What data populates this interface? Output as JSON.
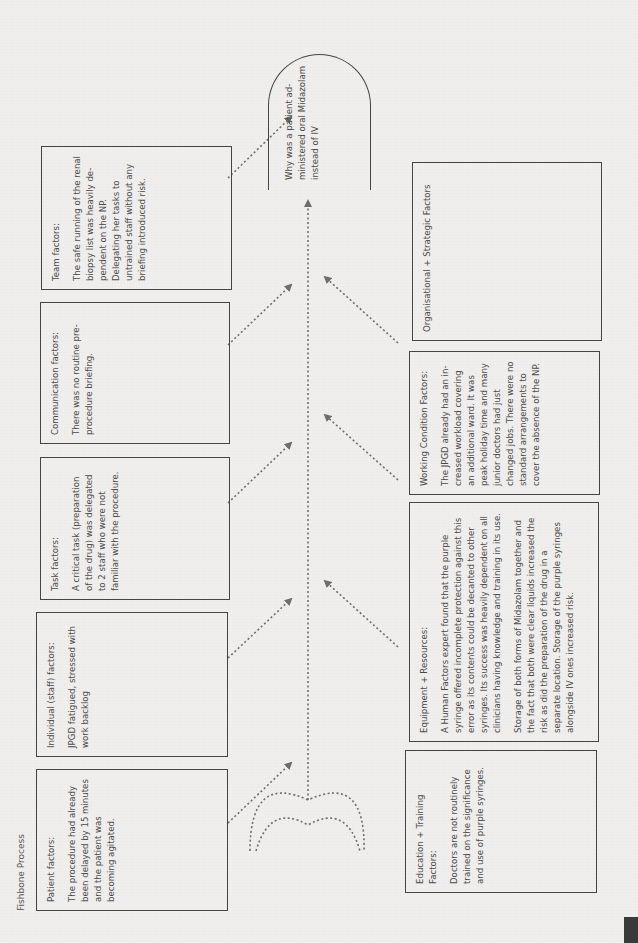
{
  "title": "Fishbone Process",
  "problem": "Why was a patient ad- ministered oral Midazolam instead of IV",
  "top_factors": [
    {
      "id": "patient",
      "heading": "Patient factors:",
      "paragraphs": [
        "The procedure had already been delayed by 15 minutes and the patient was becoming agitated."
      ]
    },
    {
      "id": "individual",
      "heading": "Individual (staff) factors:",
      "paragraphs": [
        "JPGD fatigued, stressed with work backlog"
      ]
    },
    {
      "id": "task",
      "heading": "Task factors:",
      "paragraphs": [
        "A critical task (preparation of the drug) was delegated to 2 staff who were not familiar with the procedure."
      ]
    },
    {
      "id": "communication",
      "heading": "Communication factors:",
      "paragraphs": [
        "There was no routine pre- procedure briefing."
      ]
    },
    {
      "id": "team",
      "heading": "Team factors:",
      "paragraphs": [
        "The safe running of the renal biopsy list was heavily de- pendent on the NP. Delegating her tasks to untrained staff without any briefing introduced risk."
      ]
    }
  ],
  "bottom_factors": [
    {
      "id": "education",
      "heading": "Education + Training Factors:",
      "paragraphs": [
        "Doctors are not routinely trained on the significance and use of purple syringes."
      ]
    },
    {
      "id": "equipment",
      "heading": "Equipment + Resources:",
      "paragraphs": [
        "A Human Factors expert found that the purple syringe offered incomplete protection against this error as its contents could be decanted to other syringes. Its success was heavily dependent on all clinicians having knowledge and training in its use.",
        "Storage of both forms of Midazolam together and the fact that both were clear liquids increased the risk as did the preparation of the drug in a separate location. Storage of the purple syringes alongside IV ones increased risk."
      ]
    },
    {
      "id": "working",
      "heading": "Working Condition Factors:",
      "paragraphs": [
        "The JPGD already had an in- creased workload covering an additional ward. It was peak holiday time and many junior doctors had just changed jobs. There were no standard arrangements to cover the absence of the NP."
      ]
    },
    {
      "id": "organisational",
      "heading": "Organisational + Strategic Factors",
      "paragraphs": []
    }
  ],
  "colors": {
    "line": "#6e6e6e",
    "border": "#444444",
    "text": "#4a4a4a",
    "background": "#efeeec"
  }
}
